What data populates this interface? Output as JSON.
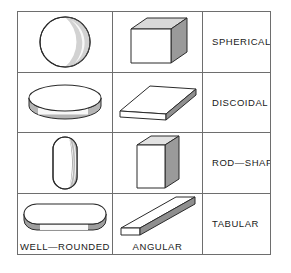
{
  "figure": {
    "columns": [
      {
        "key": "well_rounded",
        "footer": "WELL—ROUNDED"
      },
      {
        "key": "angular",
        "footer": "ANGULAR"
      },
      {
        "key": "category",
        "footer": ""
      }
    ],
    "rows": [
      {
        "category": "SPHERICAL",
        "well_rounded_shape": "sphere",
        "angular_shape": "cube"
      },
      {
        "category": "DISCOIDAL",
        "well_rounded_shape": "disc-cylinder",
        "angular_shape": "flat-slab"
      },
      {
        "category": "ROD—SHAPED",
        "well_rounded_shape": "capsule",
        "angular_shape": "tall-box"
      },
      {
        "category": "TABULAR",
        "well_rounded_shape": "rounded-flat-slab",
        "angular_shape": "thin-elongated-slab"
      }
    ],
    "colors": {
      "outline": "#2b2b2b",
      "border": "#6e6e6e",
      "face_light": "#ffffff",
      "face_mid": "#d9d9d9",
      "face_dark": "#9a9a9a",
      "text": "#1a1a1a",
      "background": "#ffffff"
    }
  }
}
